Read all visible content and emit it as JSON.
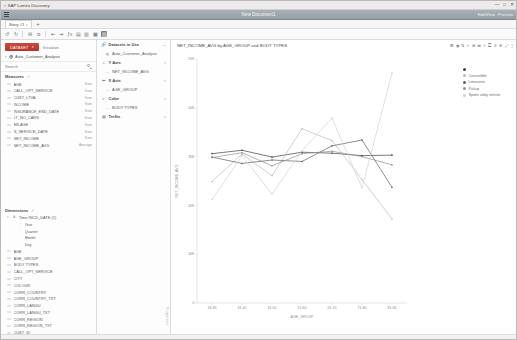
{
  "os": {
    "back_icon": "chevron-left-icon",
    "title": "SAP Lumira Discovery",
    "minimize": "—",
    "maximize": "□",
    "close": "✕"
  },
  "ribbon": {
    "menu_icon": "hamburger-icon",
    "document_title": "New Document1",
    "edit_label": "Edit/View",
    "preview_label": "Preview"
  },
  "tabs": {
    "items": [
      {
        "label": "Story #1",
        "caret": "▾"
      }
    ],
    "add_label": "+"
  },
  "viz_toolbar": {
    "icons": [
      "undo-icon",
      "redo-icon",
      "minus-icon",
      "copy-icon",
      "paste-icon",
      "align-left-icon",
      "align-right-icon",
      "function-icon",
      "bar-chart-icon",
      "column-chart-icon",
      "area-chart-icon",
      "line-chart-icon"
    ],
    "selected_icon": "line-chart-icon"
  },
  "left_panel": {
    "dataset_button": "DATASET",
    "dataset_button_caret": "▾",
    "visualize_label": "Visualize",
    "dataset": {
      "caret": "▾",
      "icon": "database-icon",
      "name": "Auto_Customer_Analysis"
    },
    "search": {
      "placeholder": "Search",
      "value": "",
      "icon": "search-icon"
    },
    "measures": {
      "title": "Measures",
      "check_icon": "✓",
      "items": [
        {
          "icon": "measure-icon",
          "name": "AGE",
          "agg": "Sum"
        },
        {
          "icon": "measure-icon",
          "name": "CALL_OPT_SERVICE",
          "agg": "Sum"
        },
        {
          "icon": "measure-icon",
          "name": "CUST_LTVA",
          "agg": "Sum"
        },
        {
          "icon": "measure-icon",
          "name": "INCOME",
          "agg": "Sum"
        },
        {
          "icon": "measure-icon",
          "name": "INSURANCE_END_DATE",
          "agg": "Sum"
        },
        {
          "icon": "measure-icon",
          "name": "LT_NO_CARS",
          "agg": "Sum"
        },
        {
          "icon": "measure-icon",
          "name": "MILAGE",
          "agg": "Sum"
        },
        {
          "icon": "measure-icon",
          "name": "N_SERVICE_DATE",
          "agg": "Sum"
        },
        {
          "icon": "measure-icon",
          "name": "NET_INCOME",
          "agg": "Sum"
        },
        {
          "icon": "measure-icon",
          "name": "NET_INCOME_AVG",
          "agg": "Average"
        }
      ]
    },
    "dimensions": {
      "title": "Dimensions",
      "check_icon": "✓",
      "items": [
        {
          "icon": "time-hierarchy-icon",
          "name": "Time.INCD_DATE (1)",
          "indent": 0,
          "caret": "▾"
        },
        {
          "icon": "level-icon",
          "name": "Year",
          "indent": 2
        },
        {
          "icon": "level-icon",
          "name": "Quarter",
          "indent": 2
        },
        {
          "icon": "level-icon",
          "name": "Month",
          "indent": 2
        },
        {
          "icon": "level-icon",
          "name": "Day",
          "indent": 2
        },
        {
          "icon": "dimension-icon",
          "name": "AGE",
          "indent": 0
        },
        {
          "icon": "dimension-icon",
          "name": "AGE_GROUP",
          "indent": 0
        },
        {
          "icon": "dimension-icon",
          "name": "BODY TYPES",
          "indent": 0
        },
        {
          "icon": "dimension-icon",
          "name": "CALL_OPT_SERVICE",
          "indent": 0
        },
        {
          "icon": "dimension-icon",
          "name": "CITY",
          "indent": 0
        },
        {
          "icon": "dimension-icon",
          "name": "COLOUR",
          "indent": 0
        },
        {
          "icon": "dimension-icon",
          "name": "CORR_COUNTRY",
          "indent": 0
        },
        {
          "icon": "dimension-icon",
          "name": "CORR_COUNTRY_TXT",
          "indent": 0
        },
        {
          "icon": "dimension-icon",
          "name": "CORR_LANGU",
          "indent": 0
        },
        {
          "icon": "dimension-icon",
          "name": "CORR_LANGU_TXT",
          "indent": 0
        },
        {
          "icon": "dimension-icon",
          "name": "CORR_REGION",
          "indent": 0
        },
        {
          "icon": "dimension-icon",
          "name": "CORR_REGION_TXT",
          "indent": 0
        },
        {
          "icon": "dimension-icon",
          "name": "CUST_ID",
          "indent": 0
        },
        {
          "icon": "dimension-icon",
          "name": "CUST_LTVA",
          "indent": 0
        }
      ]
    }
  },
  "shelf_panel": {
    "datasets_in_use": {
      "icon": "link-icon",
      "label": "Datasets in Use",
      "right_icon": "more-icon"
    },
    "dataset_entry": {
      "icon": "database-icon",
      "label": "Auto_Customer_Analysis"
    },
    "shelves": [
      {
        "icon": "y-axis-icon",
        "label": "Y Axis",
        "items": [
          {
            "icon": "measure-icon",
            "name": "NET_INCOME_AVG"
          }
        ]
      },
      {
        "icon": "x-axis-icon",
        "label": "X Axis",
        "items": [
          {
            "icon": "dimension-icon",
            "name": "AGE_GROUP"
          }
        ]
      },
      {
        "icon": "color-icon",
        "label": "Color",
        "items": [
          {
            "icon": "dimension-icon",
            "name": "BODY TYPES"
          }
        ]
      },
      {
        "icon": "trellis-icon",
        "label": "Trellis",
        "items": []
      }
    ],
    "side_text": "Properties"
  },
  "chart_panel": {
    "title": "NET_INCOME_AVG by AGE_GROUP and BODY TYPES",
    "toolbar_icons": [
      "filter-icon",
      "ranking-icon",
      "sort-icon",
      "input-controls-icon",
      "calculation-icon",
      "drill-icon",
      "reference-line-icon",
      "conditional-format-icon",
      "legend-icon",
      "settings-icon",
      "expand-icon",
      "more-icon"
    ]
  },
  "chart_data": {
    "type": "line",
    "title": "NET_INCOME_AVG by AGE_GROUP and BODY TYPES",
    "xlabel": "AGE_GROUP",
    "ylabel": "NET_INCOME_AVG",
    "categories": [
      "18-30",
      "31-40",
      "41-50",
      "51-60",
      "61-70",
      "71-80",
      "81-90"
    ],
    "ylim": [
      0,
      50000
    ],
    "yticks": [
      0,
      10000,
      20000,
      30000,
      40000,
      50000
    ],
    "ytick_labels": [
      "0",
      "10K",
      "20K",
      "30K",
      "40K",
      "50K"
    ],
    "grid": false,
    "legend_position": "right",
    "series": [
      {
        "name": "",
        "color": "#3d4045",
        "values": [
          30600,
          31300,
          29900,
          30900,
          30700,
          30200,
          30300
        ]
      },
      {
        "name": "Convertible",
        "color": "#b8bcc1",
        "values": [
          24900,
          30500,
          26100,
          35700,
          33300,
          25300,
          17200
        ]
      },
      {
        "name": "Limousine",
        "color": "#5a5f66",
        "values": [
          29900,
          28600,
          29300,
          29000,
          32200,
          33400,
          23700
        ]
      },
      {
        "name": "Pickup",
        "color": "#8d9298",
        "values": [
          29800,
          30800,
          28100,
          30600,
          31100,
          30000,
          28300
        ]
      },
      {
        "name": "Sports utility vehicle",
        "color": "#cfd3d7",
        "values": [
          21200,
          30200,
          22300,
          31200,
          37900,
          23600,
          47100
        ]
      }
    ]
  }
}
